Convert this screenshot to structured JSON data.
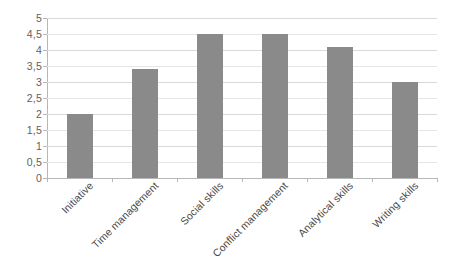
{
  "chart_data": {
    "type": "bar",
    "title": "",
    "subtitle": "",
    "xlabel": "",
    "ylabel": "",
    "categories": [
      "Initiative",
      "Time management",
      "Social skills",
      "Conflict management",
      "Analytical skills",
      "Writing skills"
    ],
    "values": [
      2,
      3.4,
      4.5,
      4.5,
      4.1,
      3
    ],
    "ylim": [
      0,
      5
    ],
    "ytick_step": 0.5,
    "ytick_labels": [
      "0",
      "0,5",
      "1",
      "1,5",
      "2",
      "2,5",
      "3",
      "3,5",
      "4",
      "4,5",
      "5"
    ],
    "ytick_values": [
      0,
      0.5,
      1,
      1.5,
      2,
      2.5,
      3,
      3.5,
      4,
      4.5,
      5
    ],
    "grid": true,
    "grid_axis": "y",
    "legend": false,
    "legend_position": "none",
    "decimal_separator": ",",
    "xtick_label_rotation": -45,
    "colors": {
      "bar_fill": "#8a8a8a",
      "gridline": "#d9d9d9",
      "axis_line": "#b7b7b7",
      "tick_label": "#5f5f5f",
      "category_label": "#4a4a4a",
      "background": "#ffffff"
    }
  }
}
